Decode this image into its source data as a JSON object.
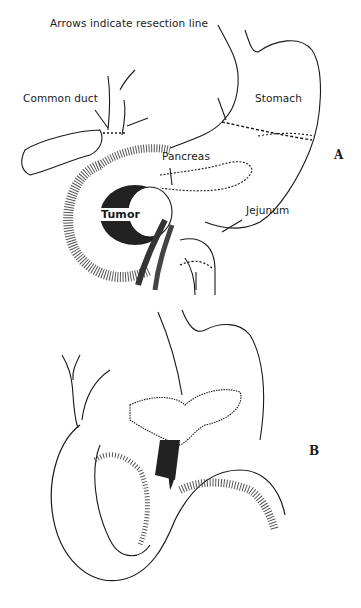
{
  "figure": {
    "caption": "Arrows indicate resection line",
    "panels": [
      {
        "id": "A",
        "label": "A",
        "structures": [
          {
            "name": "Common duct",
            "label": "Common duct"
          },
          {
            "name": "Stomach",
            "label": "Stomach"
          },
          {
            "name": "Pancreas",
            "label": "Pancreas"
          },
          {
            "name": "Tumor",
            "label": "Tumor"
          },
          {
            "name": "Jejunum",
            "label": "Jejunum"
          }
        ]
      },
      {
        "id": "B",
        "label": "B"
      }
    ],
    "colors": {
      "ink": "#1a1a1a",
      "background": "#ffffff"
    }
  }
}
